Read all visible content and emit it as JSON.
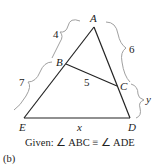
{
  "figure": {
    "points": {
      "A": {
        "label": "A",
        "x": 94,
        "y": 27
      },
      "B": {
        "label": "B",
        "x": 66,
        "y": 64
      },
      "C": {
        "label": "C",
        "x": 117,
        "y": 86
      },
      "D": {
        "label": "D",
        "x": 130,
        "y": 118
      },
      "E": {
        "label": "E",
        "x": 24,
        "y": 118
      }
    },
    "segment_labels": {
      "AB": "4",
      "BE": "7",
      "BC": "5",
      "AC": "6",
      "CD": "y",
      "ED": "x"
    },
    "given": "Given: ∠ ABC ≡ ∠ ADE",
    "caption": "(b)",
    "stroke_color": "#222222",
    "brace_color": "#9a9a9a"
  }
}
